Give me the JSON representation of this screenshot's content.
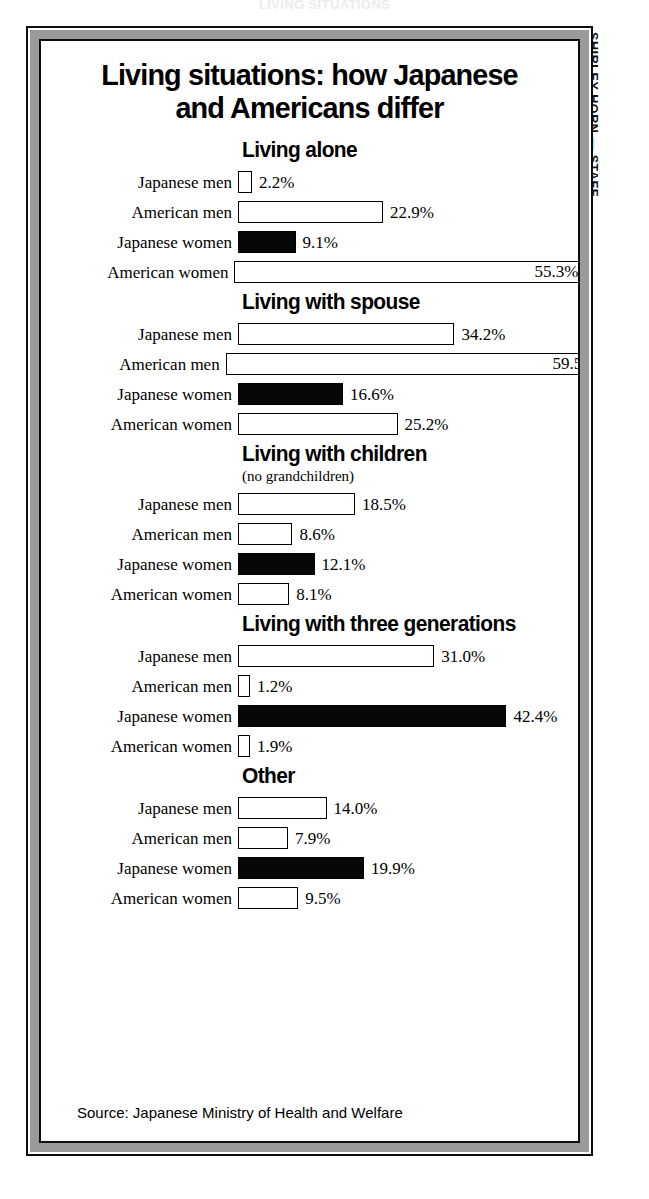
{
  "top_remnant": "LIVING SITUATIONS",
  "credit": "SHIRLEY HORN — STAFF",
  "title": {
    "line1": "Living situations: how Japanese",
    "line2": "and Americans differ"
  },
  "source": "Source: Japanese Ministry of Health and Welfare",
  "colors": {
    "ink": "#000000",
    "filled_bar": "#070707",
    "open_bar": "#ffffff",
    "frame_band": "#9a9a9a",
    "page_background": "#ffffff"
  },
  "chart_data": {
    "type": "bar",
    "title": "Living situations: how Japanese and Americans differ",
    "subtitle": "",
    "orientation": "horizontal",
    "xlabel": "",
    "ylabel": "",
    "unit": "%",
    "xlim": [
      0,
      60
    ],
    "grid": false,
    "legend": "none",
    "value_label_format": "{v}%",
    "categories": [
      "Japanese men",
      "American men",
      "Japanese women",
      "American women"
    ],
    "panels": [
      {
        "title": "Living alone",
        "subtitle": "",
        "bars": [
          {
            "label": "Japanese men",
            "value": 2.2,
            "display": "2.2%",
            "fill": "open"
          },
          {
            "label": "American men",
            "value": 22.9,
            "display": "22.9%",
            "fill": "open"
          },
          {
            "label": "Japanese women",
            "value": 9.1,
            "display": "9.1%",
            "fill": "filled"
          },
          {
            "label": "American women",
            "value": 55.3,
            "display": "55.3%",
            "fill": "open"
          }
        ]
      },
      {
        "title": "Living with spouse",
        "subtitle": "",
        "bars": [
          {
            "label": "Japanese men",
            "value": 34.2,
            "display": "34.2%",
            "fill": "open"
          },
          {
            "label": "American men",
            "value": 59.5,
            "display": "59.5%",
            "fill": "open"
          },
          {
            "label": "Japanese women",
            "value": 16.6,
            "display": "16.6%",
            "fill": "filled"
          },
          {
            "label": "American women",
            "value": 25.2,
            "display": "25.2%",
            "fill": "open"
          }
        ]
      },
      {
        "title": "Living with children",
        "subtitle": "(no grandchildren)",
        "bars": [
          {
            "label": "Japanese men",
            "value": 18.5,
            "display": "18.5%",
            "fill": "open"
          },
          {
            "label": "American men",
            "value": 8.6,
            "display": "8.6%",
            "fill": "open"
          },
          {
            "label": "Japanese women",
            "value": 12.1,
            "display": "12.1%",
            "fill": "filled"
          },
          {
            "label": "American women",
            "value": 8.1,
            "display": "8.1%",
            "fill": "open"
          }
        ]
      },
      {
        "title": "Living with three generations",
        "subtitle": "",
        "bars": [
          {
            "label": "Japanese men",
            "value": 31.0,
            "display": "31.0%",
            "fill": "open"
          },
          {
            "label": "American men",
            "value": 1.2,
            "display": "1.2%",
            "fill": "open"
          },
          {
            "label": "Japanese women",
            "value": 42.4,
            "display": "42.4%",
            "fill": "filled"
          },
          {
            "label": "American women",
            "value": 1.9,
            "display": "1.9%",
            "fill": "open"
          }
        ]
      },
      {
        "title": "Other",
        "subtitle": "",
        "bars": [
          {
            "label": "Japanese men",
            "value": 14.0,
            "display": "14.0%",
            "fill": "open"
          },
          {
            "label": "American men",
            "value": 7.9,
            "display": "7.9%",
            "fill": "open"
          },
          {
            "label": "Japanese women",
            "value": 19.9,
            "display": "19.9%",
            "fill": "filled"
          },
          {
            "label": "American women",
            "value": 9.5,
            "display": "9.5%",
            "fill": "open"
          }
        ]
      }
    ]
  }
}
